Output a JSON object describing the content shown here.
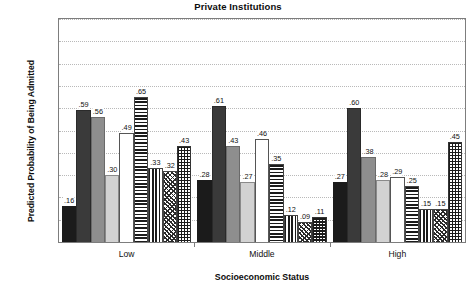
{
  "chart_data": {
    "type": "bar",
    "title": "Private Institutions",
    "xlabel": "Socioeconomic Status",
    "ylabel": "Predicted Probability of Being Admitted",
    "categories": [
      "Low",
      "Middle",
      "High"
    ],
    "ylim": [
      0.0,
      1.0
    ],
    "ytick_labels": [
      "0.0",
      "0.1",
      "0.2",
      "0.3",
      "0.4",
      "0.5",
      "0.6",
      "0.7",
      "0.8",
      "0.9",
      "1.0"
    ],
    "ytick_values": [
      0.0,
      0.1,
      0.2,
      0.3,
      0.4,
      0.5,
      0.6,
      0.7,
      0.8,
      0.9,
      1.0
    ],
    "grid": true,
    "legend": "none",
    "series": [
      {
        "name": "series-1",
        "pattern": "solid-black",
        "values": [
          0.16,
          0.28,
          0.27
        ],
        "labels": [
          ".16",
          ".28",
          ".27"
        ]
      },
      {
        "name": "series-2",
        "pattern": "dark-gray",
        "values": [
          0.59,
          0.61,
          0.6
        ],
        "labels": [
          ".59",
          ".61",
          ".60"
        ]
      },
      {
        "name": "series-3",
        "pattern": "mid-gray",
        "values": [
          0.56,
          0.43,
          0.38
        ],
        "labels": [
          ".56",
          ".43",
          ".38"
        ]
      },
      {
        "name": "series-4",
        "pattern": "light-gray",
        "values": [
          0.3,
          0.27,
          0.28
        ],
        "labels": [
          ".30",
          ".27",
          ".28"
        ]
      },
      {
        "name": "series-5",
        "pattern": "white",
        "values": [
          0.49,
          0.46,
          0.29
        ],
        "labels": [
          ".49",
          ".46",
          ".29"
        ]
      },
      {
        "name": "series-6",
        "pattern": "hstripe",
        "values": [
          0.65,
          0.35,
          0.25
        ],
        "labels": [
          ".65",
          ".35",
          ".25"
        ]
      },
      {
        "name": "series-7",
        "pattern": "vstripe",
        "values": [
          0.33,
          0.12,
          0.15
        ],
        "labels": [
          ".33",
          ".12",
          ".15"
        ]
      },
      {
        "name": "series-8",
        "pattern": "diag",
        "values": [
          0.32,
          0.09,
          0.15
        ],
        "labels": [
          ".32",
          ".09",
          ".15"
        ]
      },
      {
        "name": "series-9",
        "pattern": "checker",
        "values": [
          0.43,
          0.11,
          0.45
        ],
        "labels": [
          ".43",
          ".11",
          ".45"
        ]
      }
    ]
  },
  "colors": {
    "frame": "#7d7d7d",
    "grid": "#b9b9b9",
    "text": "#111111",
    "background": "#ffffff"
  }
}
